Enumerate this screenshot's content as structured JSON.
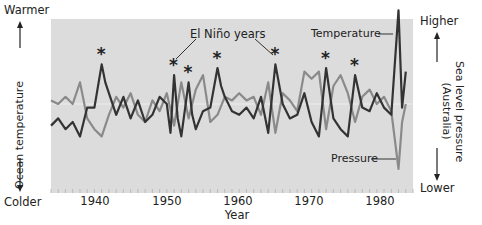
{
  "chart_data": {
    "type": "line",
    "title": "",
    "xlabel": "Year",
    "ylabel_left": "Ocean temperature",
    "ylabel_right": "Sea level pressure (Australia)",
    "left_axis_top": "Warmer",
    "left_axis_bottom": "Colder",
    "right_axis_top": "Higher",
    "right_axis_bottom": "Lower",
    "xlim": [
      1934,
      1984
    ],
    "x_ticks": [
      1940,
      1950,
      1960,
      1970,
      1980
    ],
    "grid": false,
    "annotation": "El Niño years",
    "el_nino_years": [
      1941,
      1951,
      1953,
      1957,
      1965,
      1972,
      1976
    ],
    "series": [
      {
        "name": "Temperature",
        "color": "#333333",
        "x": [
          1934,
          1935,
          1936,
          1937,
          1938,
          1939,
          1940,
          1941,
          1941.5,
          1942,
          1943,
          1944,
          1945,
          1946,
          1947,
          1948,
          1949,
          1950,
          1950.5,
          1951,
          1951.5,
          1952,
          1953,
          1953.5,
          1954,
          1955,
          1956,
          1957,
          1957.5,
          1958,
          1959,
          1960,
          1961,
          1962,
          1963,
          1964,
          1965,
          1966,
          1967,
          1968,
          1969,
          1970,
          1971,
          1972,
          1973,
          1974,
          1975,
          1976,
          1977,
          1978,
          1979,
          1980,
          1981,
          1982,
          1982.5,
          1983
        ],
        "values": [
          -0.6,
          -0.4,
          -0.7,
          -0.5,
          -0.9,
          -0.1,
          -0.1,
          1.1,
          0.6,
          0.3,
          -0.3,
          0.2,
          -0.4,
          0.1,
          -0.5,
          -0.3,
          0.2,
          0.0,
          -0.8,
          0.8,
          -0.4,
          -0.9,
          0.6,
          -0.3,
          -0.7,
          -0.2,
          -0.1,
          1.0,
          0.5,
          0.2,
          -0.2,
          -0.3,
          -0.1,
          -0.4,
          0.2,
          -0.8,
          1.1,
          0.0,
          -0.4,
          -0.3,
          0.3,
          -0.5,
          -0.9,
          1.0,
          -0.4,
          -0.7,
          -0.9,
          0.8,
          -0.1,
          -0.2,
          0.3,
          -0.1,
          -0.3,
          2.6,
          -0.1,
          0.9
        ]
      },
      {
        "name": "Pressure",
        "color": "#8a8a8a",
        "x": [
          1934,
          1935,
          1936,
          1937,
          1938,
          1939,
          1940,
          1941,
          1942,
          1943,
          1944,
          1945,
          1946,
          1947,
          1948,
          1949,
          1950,
          1951,
          1952,
          1953,
          1954,
          1955,
          1956,
          1957,
          1958,
          1959,
          1960,
          1961,
          1962,
          1963,
          1964,
          1965,
          1966,
          1967,
          1968,
          1969,
          1970,
          1971,
          1972,
          1973,
          1974,
          1975,
          1976,
          1977,
          1978,
          1979,
          1980,
          1981,
          1982,
          1982.5,
          1983
        ],
        "values": [
          0.1,
          0.0,
          0.2,
          0.0,
          0.6,
          -0.4,
          -0.7,
          -0.9,
          -0.3,
          0.2,
          -0.1,
          0.3,
          -0.3,
          -0.5,
          0.1,
          -0.2,
          0.3,
          -0.6,
          0.6,
          -0.4,
          0.4,
          0.8,
          -0.5,
          -0.3,
          0.2,
          0.1,
          0.3,
          0.1,
          0.2,
          -0.3,
          0.6,
          -0.8,
          0.3,
          0.1,
          -0.2,
          0.9,
          0.7,
          0.9,
          -0.7,
          0.5,
          0.8,
          0.3,
          -0.5,
          0.2,
          0.4,
          0.0,
          0.2,
          -0.2,
          -1.8,
          -0.5,
          0.0
        ]
      }
    ]
  },
  "labels": {
    "warmer": "Warmer",
    "colder": "Colder",
    "higher": "Higher",
    "lower": "Lower",
    "ocean_temperature": "Ocean temperature",
    "sea_level_pressure": "Sea level pressure",
    "australia": "(Australia)",
    "year": "Year",
    "el_nino": "El Niño years",
    "temperature": "Temperature",
    "pressure": "Pressure",
    "ticks": [
      "1940",
      "1950",
      "1960",
      "1970",
      "1980"
    ],
    "asterisk": "*"
  }
}
